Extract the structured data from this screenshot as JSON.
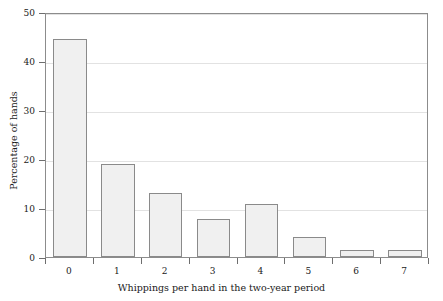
{
  "chart_data": {
    "type": "bar",
    "title": "",
    "xlabel": "Whippings per hand in the two-year period",
    "ylabel": "Percentage of hands",
    "categories": [
      "0",
      "1",
      "2",
      "3",
      "4",
      "5",
      "6",
      "7"
    ],
    "values": [
      44.5,
      19.0,
      13.0,
      7.7,
      10.8,
      4.0,
      1.5,
      1.5
    ],
    "xlim": [
      -0.5,
      7.5
    ],
    "ylim": [
      0,
      50
    ],
    "ytick_labels": [
      "0",
      "10",
      "20",
      "30",
      "40",
      "50"
    ],
    "ytick_values": [
      0,
      10,
      20,
      30,
      40,
      50
    ],
    "xtick_labels": [
      "0",
      "1",
      "2",
      "3",
      "4",
      "5",
      "6",
      "7"
    ],
    "grid": "horizontal",
    "legend": "none",
    "bar_fill_color": "#f0f0f0",
    "bar_edge_color": "#8a8a8a",
    "gridline_color": "#e2e2e2",
    "frame_color": "#8c8c8c",
    "text_color": "#1a1a1a"
  }
}
